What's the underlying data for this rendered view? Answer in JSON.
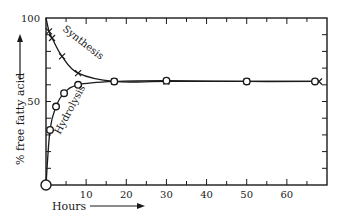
{
  "chart_data": {
    "type": "line",
    "title": "",
    "xlabel": "Hours",
    "ylabel": "% free fatty acid",
    "xlim": [
      0,
      70
    ],
    "ylim": [
      0,
      100
    ],
    "x_ticks_major": [
      10,
      20,
      30,
      40,
      50,
      60
    ],
    "x_tick_labels": [
      "10",
      "20",
      "30",
      "40",
      "50",
      "60"
    ],
    "x_ticks_minor_step": 5,
    "y_ticks_major": [
      50,
      100
    ],
    "y_tick_labels": [
      "50",
      "100"
    ],
    "y_ticks_minor_step": 10,
    "grid": false,
    "legend": "inline curve labels",
    "series": [
      {
        "name": "Synthesis",
        "marker": "x",
        "x": [
          0,
          0.75,
          1.5,
          4,
          8,
          17,
          30,
          50,
          68
        ],
        "y": [
          100,
          92,
          88,
          77,
          67,
          62,
          62,
          62,
          62
        ]
      },
      {
        "name": "Hydrolysis",
        "marker": "o",
        "x": [
          0,
          1,
          2.5,
          4.5,
          8,
          17,
          30,
          50,
          67
        ],
        "y": [
          0,
          33,
          47,
          55,
          60,
          62,
          62.5,
          62,
          62
        ]
      }
    ],
    "annotations": [
      "Synthesis",
      "Hydrolysis"
    ],
    "arrows": [
      "y-axis label arrow pointing up",
      "x-axis label arrow pointing right"
    ]
  },
  "labels": {
    "y_top": "100",
    "y_mid": "50",
    "x_axis_title": "Hours",
    "y_axis_title": "% free fatty acid",
    "synthesis": "Synthesis",
    "hydrolysis": "Hydrolysis"
  },
  "colors": {
    "ink": "#1a1a1a",
    "background": "#ffffff"
  }
}
